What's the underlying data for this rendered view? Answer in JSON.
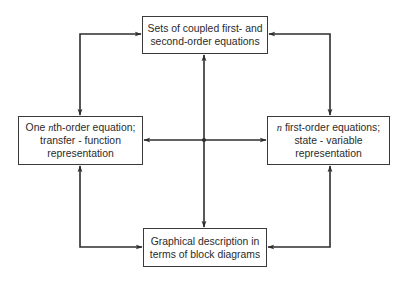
{
  "diagram": {
    "type": "flow-diagram",
    "colors": {
      "line": "#2e2e2e",
      "box_border": "#3a3a3a",
      "text": "#2b2b2b",
      "background": "#ffffff"
    },
    "nodes": {
      "top": {
        "lines": [
          "Sets of coupled first- and",
          "second-order equations"
        ]
      },
      "left": {
        "line1_prefix": "One ",
        "line1_var": "n",
        "line1_suffix": "th-order equation;",
        "line2": "transfer - function",
        "line3": "representation"
      },
      "right": {
        "line1_var": "n",
        "line1_suffix": " first-order equations;",
        "line2": "state - variable",
        "line3": "representation"
      },
      "bottom": {
        "lines": [
          "Graphical description in",
          "terms of block diagrams"
        ]
      }
    },
    "edges": [
      {
        "from": "top",
        "to": "left",
        "bidirectional": true,
        "route": "left loop"
      },
      {
        "from": "top",
        "to": "right",
        "bidirectional": true,
        "route": "right loop"
      },
      {
        "from": "left",
        "to": "bottom",
        "bidirectional": true,
        "route": "left loop"
      },
      {
        "from": "right",
        "to": "bottom",
        "bidirectional": true,
        "route": "right loop"
      },
      {
        "from": "top",
        "to": "bottom",
        "bidirectional": true,
        "route": "center vertical through junction"
      },
      {
        "from": "left",
        "to": "right",
        "bidirectional": true,
        "route": "center horizontal through junction"
      }
    ]
  }
}
